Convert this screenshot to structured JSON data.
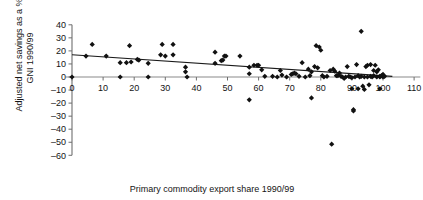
{
  "chart_data": {
    "type": "scatter",
    "title": "",
    "xlabel": "Primary commodity export share 1990/99",
    "ylabel_line1": "Adjusted net savings as a % of",
    "ylabel_line2": "GNI 1990/99",
    "xlim": [
      -2,
      112
    ],
    "ylim": [
      -60,
      40
    ],
    "xticks": [
      0,
      10,
      20,
      30,
      40,
      50,
      60,
      70,
      80,
      90,
      100,
      110
    ],
    "xtick_labels": [
      "0",
      "10",
      "20",
      "30",
      "40",
      "50",
      "60",
      "70",
      "80",
      "90",
      "100",
      "110"
    ],
    "yticks": [
      40,
      30,
      20,
      10,
      0,
      -10,
      -20,
      -30,
      -40,
      -50,
      -60
    ],
    "ytick_labels": [
      "40",
      "30",
      "20",
      "10",
      "0",
      "–10",
      "–20",
      "–30",
      "–40",
      "–50",
      "–60"
    ],
    "grid": false,
    "legend": "none",
    "marker": "diamond",
    "marker_color": "#111111",
    "axis_color": "#6e6e6e",
    "zero_line_color": "#8a8a8a",
    "trendline": {
      "show": true,
      "color": "#1a1a1a",
      "x_start": 0,
      "y_start": 17,
      "x_end": 103,
      "y_end": 0.5
    },
    "points": [
      [
        0,
        0
      ],
      [
        4.5,
        16
      ],
      [
        6.5,
        25
      ],
      [
        11,
        16
      ],
      [
        15.5,
        0
      ],
      [
        15.5,
        11
      ],
      [
        17.5,
        11
      ],
      [
        18.5,
        24
      ],
      [
        19,
        11.5
      ],
      [
        21,
        13.5
      ],
      [
        21.5,
        13
      ],
      [
        24.5,
        10.5
      ],
      [
        24.5,
        0
      ],
      [
        28.5,
        17
      ],
      [
        29,
        25
      ],
      [
        30,
        16
      ],
      [
        32.5,
        17
      ],
      [
        32.5,
        25
      ],
      [
        36.5,
        7.5
      ],
      [
        36.5,
        4
      ],
      [
        37,
        0
      ],
      [
        46,
        19
      ],
      [
        46,
        10.5
      ],
      [
        48,
        12.5
      ],
      [
        48.5,
        13
      ],
      [
        49,
        16
      ],
      [
        49.5,
        16
      ],
      [
        54,
        16
      ],
      [
        57,
        7.5
      ],
      [
        57,
        2.5
      ],
      [
        57,
        -17.5
      ],
      [
        58.5,
        9
      ],
      [
        59.5,
        9
      ],
      [
        60,
        9
      ],
      [
        61,
        5.5
      ],
      [
        64.5,
        0.5
      ],
      [
        67,
        5
      ],
      [
        67.5,
        1.5
      ],
      [
        69,
        0
      ],
      [
        70.5,
        2
      ],
      [
        71,
        2.5
      ],
      [
        71.5,
        3
      ],
      [
        72,
        2.5
      ],
      [
        74,
        11
      ],
      [
        76,
        6
      ],
      [
        76.5,
        1
      ],
      [
        77,
        4
      ],
      [
        77,
        -16
      ],
      [
        78,
        8
      ],
      [
        78.5,
        24
      ],
      [
        79,
        7
      ],
      [
        79.5,
        23
      ],
      [
        80,
        20.5
      ],
      [
        80.5,
        1
      ],
      [
        82,
        0.5
      ],
      [
        83,
        5
      ],
      [
        84,
        6
      ],
      [
        84.5,
        4.5
      ],
      [
        85,
        1
      ],
      [
        85.5,
        1
      ],
      [
        86,
        3
      ],
      [
        86.5,
        0.5
      ],
      [
        87,
        0
      ],
      [
        88,
        0
      ],
      [
        88.5,
        8
      ],
      [
        89,
        0.5
      ],
      [
        89.5,
        0
      ],
      [
        90,
        -0.5
      ],
      [
        90,
        -9
      ],
      [
        90.5,
        -25
      ],
      [
        90.5,
        -26
      ],
      [
        91,
        0
      ],
      [
        91.5,
        9.5
      ],
      [
        92,
        1
      ],
      [
        92.5,
        0
      ],
      [
        93,
        35
      ],
      [
        93,
        0.5
      ],
      [
        93.5,
        -7
      ],
      [
        94,
        0
      ],
      [
        94.5,
        8
      ],
      [
        95,
        9
      ],
      [
        95,
        0
      ],
      [
        95.5,
        -6
      ],
      [
        96,
        9.5
      ],
      [
        96,
        0.5
      ],
      [
        96.5,
        0
      ],
      [
        97,
        5
      ],
      [
        97,
        1
      ],
      [
        97.5,
        9
      ],
      [
        98,
        4
      ],
      [
        98,
        0
      ],
      [
        98.5,
        5.5
      ],
      [
        99,
        0.5
      ],
      [
        99,
        0
      ],
      [
        99.5,
        1
      ],
      [
        100,
        0
      ],
      [
        100,
        2
      ],
      [
        100.5,
        0.5
      ],
      [
        83.5,
        -51.5
      ],
      [
        62,
        0.5
      ],
      [
        66,
        0
      ],
      [
        73,
        0.5
      ],
      [
        75,
        0
      ],
      [
        81,
        0
      ],
      [
        87.5,
        -1
      ],
      [
        92,
        -9
      ],
      [
        94,
        -9.5
      ],
      [
        99,
        -9
      ]
    ]
  }
}
